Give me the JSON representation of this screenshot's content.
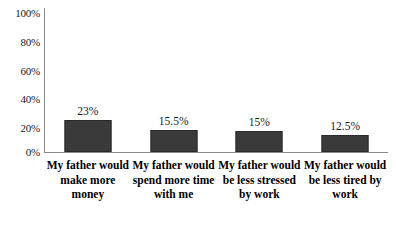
{
  "chart_data": {
    "type": "bar",
    "title": "",
    "subtitle": "",
    "xlabel": "",
    "ylabel": "",
    "categories": [
      "My father would make more money",
      "My father would spend more time with me",
      "My father would be less stressed by work",
      "My father would be less tired by work"
    ],
    "values": [
      23,
      15.5,
      15,
      12.5
    ],
    "value_labels": [
      "23%",
      "15.5%",
      "15%",
      "12.5%"
    ],
    "ylim": [
      0,
      100
    ],
    "ytick_values": [
      100,
      80,
      60,
      40,
      20,
      0
    ],
    "ytick_labels": [
      "100%",
      "80%",
      "60%",
      "40%",
      "20%",
      "0%"
    ],
    "grid": false,
    "legend": false,
    "legend_position": "none",
    "bar_color": "#3a3a3a",
    "axis_color": "#8a8a8a",
    "background_color": "#ffffff"
  }
}
